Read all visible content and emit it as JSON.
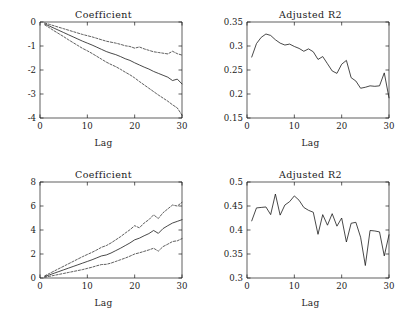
{
  "figure": {
    "background": "#ffffff",
    "line_color": "#1a1a1a",
    "rows": 2,
    "cols": 2
  },
  "panels": {
    "top_left": {
      "title": "Coefficient",
      "xlabel": "Lag"
    },
    "top_right": {
      "title": "Adjusted R2",
      "xlabel": "Lag"
    },
    "bottom_left": {
      "title": "Coefficient",
      "xlabel": "Lag"
    },
    "bottom_right": {
      "title": "Adjusted R2",
      "xlabel": "Lag"
    }
  },
  "chart_data": [
    {
      "id": "top_left",
      "type": "line",
      "title": "Coefficient",
      "xlabel": "Lag",
      "ylabel": "",
      "xlim": [
        0,
        30
      ],
      "ylim": [
        -4,
        0
      ],
      "xticks": [
        0,
        10,
        20,
        30
      ],
      "xticklabels": [
        "0",
        "10",
        "20",
        "30"
      ],
      "yticks": [
        -4,
        -3,
        -2,
        -1,
        0
      ],
      "yticklabels": [
        "-4",
        "-3",
        "-2",
        "-1",
        "0"
      ],
      "grid": false,
      "legend": "none",
      "x": [
        1,
        2,
        3,
        4,
        5,
        6,
        7,
        8,
        9,
        10,
        11,
        12,
        13,
        14,
        15,
        16,
        17,
        18,
        19,
        20,
        21,
        22,
        23,
        24,
        25,
        26,
        27,
        28,
        29,
        30
      ],
      "series": [
        {
          "name": "Coefficient estimate",
          "style": "solid",
          "values": [
            -0.08,
            -0.17,
            -0.26,
            -0.35,
            -0.44,
            -0.53,
            -0.62,
            -0.71,
            -0.8,
            -0.88,
            -0.96,
            -1.05,
            -1.14,
            -1.23,
            -1.3,
            -1.36,
            -1.44,
            -1.53,
            -1.6,
            -1.7,
            -1.79,
            -1.88,
            -1.96,
            -2.06,
            -2.14,
            -2.22,
            -2.3,
            -2.44,
            -2.38,
            -2.58
          ]
        },
        {
          "name": "Upper confidence band",
          "style": "dashed",
          "values": [
            -0.04,
            -0.1,
            -0.16,
            -0.22,
            -0.28,
            -0.34,
            -0.4,
            -0.46,
            -0.52,
            -0.57,
            -0.62,
            -0.68,
            -0.74,
            -0.8,
            -0.84,
            -0.88,
            -0.93,
            -0.99,
            -1.02,
            -1.09,
            -1.04,
            -1.12,
            -1.18,
            -1.24,
            -1.27,
            -1.3,
            -1.33,
            -1.22,
            -1.32,
            -1.38
          ]
        },
        {
          "name": "Lower confidence band",
          "style": "dashed",
          "values": [
            -0.12,
            -0.24,
            -0.37,
            -0.49,
            -0.61,
            -0.74,
            -0.86,
            -0.98,
            -1.1,
            -1.2,
            -1.31,
            -1.43,
            -1.55,
            -1.67,
            -1.77,
            -1.86,
            -1.97,
            -2.09,
            -2.2,
            -2.33,
            -2.48,
            -2.62,
            -2.76,
            -2.9,
            -3.04,
            -3.17,
            -3.3,
            -3.45,
            -3.58,
            -3.88
          ]
        }
      ]
    },
    {
      "id": "top_right",
      "type": "line",
      "title": "Adjusted R2",
      "xlabel": "Lag",
      "ylabel": "",
      "xlim": [
        0,
        30
      ],
      "ylim": [
        0.15,
        0.35
      ],
      "xticks": [
        0,
        10,
        20,
        30
      ],
      "xticklabels": [
        "0",
        "10",
        "20",
        "30"
      ],
      "yticks": [
        0.15,
        0.2,
        0.25,
        0.3,
        0.35
      ],
      "yticklabels": [
        "0.15",
        "0.2",
        "0.25",
        "0.3",
        "0.35"
      ],
      "grid": false,
      "legend": "none",
      "x": [
        1,
        2,
        3,
        4,
        5,
        6,
        7,
        8,
        9,
        10,
        11,
        12,
        13,
        14,
        15,
        16,
        17,
        18,
        19,
        20,
        21,
        22,
        23,
        24,
        25,
        26,
        27,
        28,
        29,
        30
      ],
      "series": [
        {
          "name": "Adjusted R2",
          "style": "solid",
          "values": [
            0.277,
            0.305,
            0.318,
            0.325,
            0.322,
            0.313,
            0.306,
            0.302,
            0.304,
            0.299,
            0.295,
            0.289,
            0.294,
            0.288,
            0.272,
            0.278,
            0.263,
            0.248,
            0.243,
            0.262,
            0.27,
            0.234,
            0.227,
            0.212,
            0.214,
            0.217,
            0.216,
            0.217,
            0.244,
            0.192,
            0.251,
            0.215
          ]
        }
      ]
    },
    {
      "id": "bottom_left",
      "type": "line",
      "title": "Coefficient",
      "xlabel": "Lag",
      "ylabel": "",
      "xlim": [
        0,
        30
      ],
      "ylim": [
        0,
        8
      ],
      "xticks": [
        0,
        10,
        20,
        30
      ],
      "xticklabels": [
        "0",
        "10",
        "20",
        "30"
      ],
      "yticks": [
        0,
        2,
        4,
        6,
        8
      ],
      "yticklabels": [
        "0",
        "2",
        "4",
        "6",
        "8"
      ],
      "grid": false,
      "legend": "none",
      "x": [
        1,
        2,
        3,
        4,
        5,
        6,
        7,
        8,
        9,
        10,
        11,
        12,
        13,
        14,
        15,
        16,
        17,
        18,
        19,
        20,
        21,
        22,
        23,
        24,
        25,
        26,
        27,
        28,
        29,
        30
      ],
      "series": [
        {
          "name": "Coefficient estimate",
          "style": "solid",
          "values": [
            0.12,
            0.26,
            0.4,
            0.54,
            0.68,
            0.82,
            0.96,
            1.1,
            1.24,
            1.38,
            1.52,
            1.68,
            1.84,
            1.92,
            2.08,
            2.28,
            2.48,
            2.7,
            2.92,
            3.18,
            3.32,
            3.52,
            3.7,
            3.96,
            3.72,
            4.12,
            4.36,
            4.58,
            4.72,
            4.86
          ]
        },
        {
          "name": "Upper confidence band",
          "style": "dashed",
          "values": [
            0.18,
            0.38,
            0.58,
            0.78,
            0.98,
            1.18,
            1.38,
            1.58,
            1.78,
            1.96,
            2.14,
            2.34,
            2.56,
            2.7,
            2.92,
            3.18,
            3.44,
            3.74,
            4.02,
            4.36,
            4.18,
            4.58,
            4.86,
            5.26,
            4.96,
            5.44,
            5.76,
            6.08,
            6.0,
            6.3
          ]
        },
        {
          "name": "Lower confidence band",
          "style": "dashed",
          "values": [
            0.06,
            0.14,
            0.22,
            0.3,
            0.38,
            0.46,
            0.54,
            0.62,
            0.7,
            0.8,
            0.9,
            1.02,
            1.12,
            1.14,
            1.24,
            1.38,
            1.52,
            1.66,
            1.82,
            2.0,
            2.1,
            2.22,
            2.34,
            2.48,
            2.24,
            2.62,
            2.82,
            3.04,
            3.1,
            3.28
          ]
        }
      ]
    },
    {
      "id": "bottom_right",
      "type": "line",
      "title": "Adjusted R2",
      "xlabel": "Lag",
      "ylabel": "",
      "xlim": [
        0,
        30
      ],
      "ylim": [
        0.3,
        0.5
      ],
      "xticks": [
        0,
        10,
        20,
        30
      ],
      "xticklabels": [
        "0",
        "10",
        "20",
        "30"
      ],
      "yticks": [
        0.3,
        0.35,
        0.4,
        0.45,
        0.5
      ],
      "yticklabels": [
        "0.3",
        "0.35",
        "0.4",
        "0.45",
        "0.5"
      ],
      "grid": false,
      "legend": "none",
      "x": [
        1,
        2,
        3,
        4,
        5,
        6,
        7,
        8,
        9,
        10,
        11,
        12,
        13,
        14,
        15,
        16,
        17,
        18,
        19,
        20,
        21,
        22,
        23,
        24,
        25,
        26,
        27,
        28,
        29,
        30
      ],
      "series": [
        {
          "name": "Adjusted R2",
          "style": "solid",
          "values": [
            0.419,
            0.446,
            0.447,
            0.448,
            0.432,
            0.475,
            0.431,
            0.452,
            0.459,
            0.471,
            0.462,
            0.447,
            0.441,
            0.437,
            0.391,
            0.432,
            0.41,
            0.434,
            0.408,
            0.425,
            0.375,
            0.414,
            0.416,
            0.385,
            0.326,
            0.399,
            0.398,
            0.396,
            0.346,
            0.39
          ]
        }
      ]
    }
  ]
}
